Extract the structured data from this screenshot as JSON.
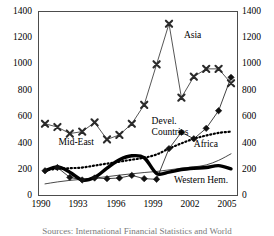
{
  "chart_data": {
    "type": "line",
    "title": "",
    "xlabel": "",
    "ylabel": "",
    "xlim": [
      1990,
      2005
    ],
    "ylim": [
      0,
      1400
    ],
    "ytick_values": [
      0,
      200,
      400,
      600,
      800,
      1000,
      1200,
      1400
    ],
    "ytick_labels_left": [
      "1400",
      "1200",
      "1000",
      "800",
      "600",
      "400",
      "200",
      "0"
    ],
    "ytick_labels_right": [
      "1400",
      "1200",
      "1000",
      "800",
      "600",
      "400",
      "200",
      "0"
    ],
    "xtick_labels": [
      "1990",
      "1993",
      "1996",
      "1999",
      "2002",
      "2005"
    ],
    "xtick_values": [
      1990,
      1993,
      1996,
      1999,
      2002,
      2005
    ],
    "grid": false,
    "legend_position": "inline-annotations",
    "dual_y_axis": true,
    "x": [
      1990,
      1991,
      1992,
      1993,
      1994,
      1995,
      1996,
      1997,
      1998,
      1999,
      2000,
      2001,
      2002,
      2003,
      2004,
      2005
    ],
    "series": [
      {
        "name": "Mid-East",
        "label": "Mid-East",
        "marker": "x",
        "linestyle": "thin-solid",
        "color": "#2b2b2b",
        "values": [
          545,
          520,
          470,
          485,
          555,
          425,
          460,
          545,
          690,
          1000,
          1310,
          745,
          905,
          965,
          965,
          855
        ]
      },
      {
        "name": "Devel. Countries",
        "label": "Devel. Countries",
        "marker": "diamond",
        "linestyle": "thin-solid",
        "color": "#111111",
        "values": [
          185,
          210,
          135,
          115,
          130,
          125,
          130,
          150,
          125,
          120,
          355,
          480,
          430,
          510,
          645,
          900
        ]
      },
      {
        "name": "Africa",
        "label": "Africa",
        "marker": "none",
        "linestyle": "dotted",
        "color": "#000000",
        "values": [
          190,
          200,
          205,
          210,
          225,
          240,
          255,
          270,
          285,
          310,
          355,
          395,
          430,
          455,
          475,
          485
        ]
      },
      {
        "name": "Western Hem.",
        "label": "Western Hem.",
        "marker": "none",
        "linestyle": "thick-solid",
        "color": "#000000",
        "values": [
          185,
          215,
          175,
          115,
          135,
          205,
          270,
          300,
          285,
          165,
          175,
          195,
          205,
          210,
          225,
          200
        ]
      },
      {
        "name": "Asia",
        "label": "Asia",
        "marker": "none",
        "linestyle": "thin-solid",
        "color": "#1a1a1a",
        "values": [
          85,
          100,
          112,
          120,
          130,
          140,
          152,
          162,
          172,
          180,
          192,
          205,
          215,
          230,
          265,
          315
        ]
      }
    ],
    "annotations": [
      {
        "text": "Asia",
        "x": 2001.2,
        "y": 1215
      },
      {
        "text": "Mid-East",
        "x": 1991.1,
        "y": 400
      },
      {
        "text": "Devel. Countries",
        "x": 1998.6,
        "y": 560
      },
      {
        "text": "Africa",
        "x": 2002.0,
        "y": 385
      },
      {
        "text": "Western Hem.",
        "x": 2000.4,
        "y": 105
      }
    ]
  },
  "caption": {
    "text": "Sources: International Financial Statistics and World"
  }
}
